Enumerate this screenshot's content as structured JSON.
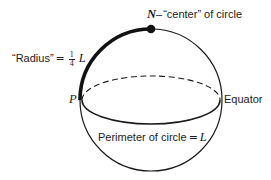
{
  "diagram": {
    "type": "sphere-geometry",
    "colors": {
      "stroke": "#1a1a1a",
      "background": "#ffffff"
    },
    "sphere": {
      "cx": 151,
      "cy": 100,
      "r": 71
    },
    "equator": {
      "cx": 151,
      "cy": 100,
      "rx": 69,
      "ry": 24
    },
    "points": {
      "north": {
        "symbol": "N",
        "x": 151,
        "y": 29
      },
      "p": {
        "symbol": "P",
        "x": 82,
        "y": 100
      }
    },
    "labels": {
      "north_symbol": "N",
      "north_dash": "–",
      "north_text": "“center” of circle",
      "radius_text": "“Radius”",
      "radius_equals": "=",
      "radius_frac_num": "1",
      "radius_frac_den": "4",
      "radius_var": "L",
      "p_label": "P",
      "equator_label": "Equator",
      "perimeter_text": "Perimeter of circle",
      "perimeter_equals": "=",
      "perimeter_var": "L"
    }
  }
}
